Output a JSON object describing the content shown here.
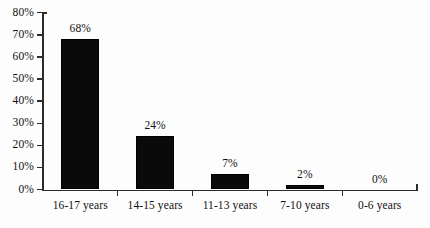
{
  "chart_data": {
    "type": "bar",
    "title": "",
    "subtitle": "",
    "xlabel": "",
    "ylabel": "",
    "categories": [
      "16-17 years",
      "14-15 years",
      "11-13 years",
      "7-10 years",
      "0-6 years"
    ],
    "values": [
      68,
      24,
      7,
      2,
      0
    ],
    "value_labels": [
      "68%",
      "24%",
      "7%",
      "2%",
      "0%"
    ],
    "ylim": [
      0,
      80
    ],
    "ytick_values": [
      0,
      10,
      20,
      30,
      40,
      50,
      60,
      70,
      80
    ],
    "ytick_labels": [
      "0%",
      "10%",
      "20%",
      "30%",
      "40%",
      "50%",
      "60%",
      "70%",
      "80%"
    ],
    "grid": false,
    "legend": false,
    "legend_position": "none",
    "series": [
      {
        "name": "",
        "values": [
          68,
          24,
          7,
          2,
          0
        ]
      }
    ]
  },
  "style": {
    "bar_color": "#0a0a0a",
    "axis_color": "#2b2b2b",
    "text_color": "#111111",
    "background": "#fdfdfd"
  }
}
